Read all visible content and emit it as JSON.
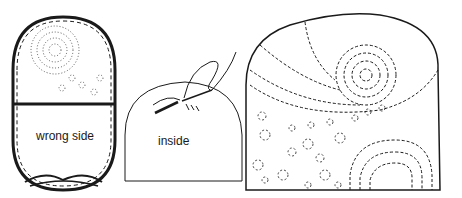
{
  "figure": {
    "panels": [
      {
        "id": "pouch",
        "label": "wrong side"
      },
      {
        "id": "sewing",
        "label": "inside"
      },
      {
        "id": "finished-cozy",
        "label": ""
      }
    ]
  },
  "colors": {
    "ink": "#1a1a1a",
    "paper": "#ffffff"
  }
}
